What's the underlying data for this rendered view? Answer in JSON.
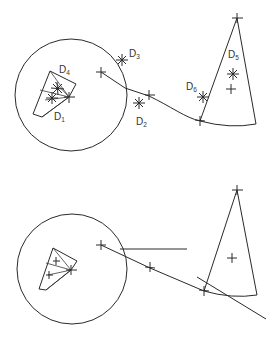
{
  "diagram": {
    "panels": [
      {
        "id": "top",
        "labels": [
          {
            "name": "D",
            "sub": "4"
          },
          {
            "name": "D",
            "sub": "1"
          },
          {
            "name": "D",
            "sub": "3"
          },
          {
            "name": "D",
            "sub": "2"
          },
          {
            "name": "D",
            "sub": "6"
          },
          {
            "name": "D",
            "sub": "5"
          }
        ]
      },
      {
        "id": "bottom",
        "labels": []
      }
    ],
    "colors": {
      "stroke": "#2a2a2a",
      "background": "#ffffff"
    }
  }
}
